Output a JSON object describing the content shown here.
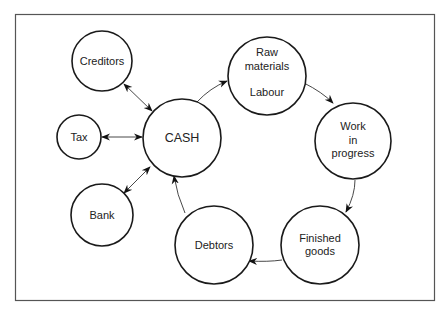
{
  "diagram": {
    "title": "",
    "type": "cash-cycle",
    "nodes": [
      {
        "id": "creditors",
        "lines": [
          "Creditors"
        ],
        "cx": 102,
        "cy": 61,
        "r": 30
      },
      {
        "id": "tax",
        "lines": [
          "Tax"
        ],
        "cx": 79,
        "cy": 137,
        "r": 22
      },
      {
        "id": "cash",
        "lines": [
          "CASH"
        ],
        "cx": 182,
        "cy": 138,
        "r": 39
      },
      {
        "id": "bank",
        "lines": [
          "Bank"
        ],
        "cx": 102,
        "cy": 215,
        "r": 31
      },
      {
        "id": "raw",
        "lines": [
          "Raw",
          "materials",
          "",
          "Labour"
        ],
        "cx": 267,
        "cy": 76,
        "r": 39
      },
      {
        "id": "wip",
        "lines": [
          "Work",
          "in",
          "progress"
        ],
        "cx": 353,
        "cy": 141,
        "r": 38
      },
      {
        "id": "finished",
        "lines": [
          "Finished",
          "goods"
        ],
        "cx": 320,
        "cy": 245,
        "r": 39
      },
      {
        "id": "debtors",
        "lines": [
          "Debtors"
        ],
        "cx": 214,
        "cy": 245,
        "r": 39
      }
    ],
    "edges": [
      {
        "from": "creditors",
        "to": "cash",
        "direction": "both"
      },
      {
        "from": "tax",
        "to": "cash",
        "direction": "both"
      },
      {
        "from": "bank",
        "to": "cash",
        "direction": "both"
      },
      {
        "from": "cash",
        "to": "raw",
        "direction": "forward"
      },
      {
        "from": "raw",
        "to": "wip",
        "direction": "forward"
      },
      {
        "from": "wip",
        "to": "finished",
        "direction": "forward"
      },
      {
        "from": "finished",
        "to": "debtors",
        "direction": "forward"
      },
      {
        "from": "debtors",
        "to": "cash",
        "direction": "forward"
      }
    ]
  },
  "labels": {
    "creditors": "Creditors",
    "tax": "Tax",
    "cash": "CASH",
    "bank": "Bank",
    "raw_1": "Raw",
    "raw_2": "materials",
    "raw_3": "Labour",
    "wip_1": "Work",
    "wip_2": "in",
    "wip_3": "progress",
    "finished_1": "Finished",
    "finished_2": "goods",
    "debtors": "Debtors"
  },
  "colors": {
    "stroke": "#1a1a1a",
    "text": "#222222",
    "frame": "#555555",
    "background": "#ffffff"
  }
}
